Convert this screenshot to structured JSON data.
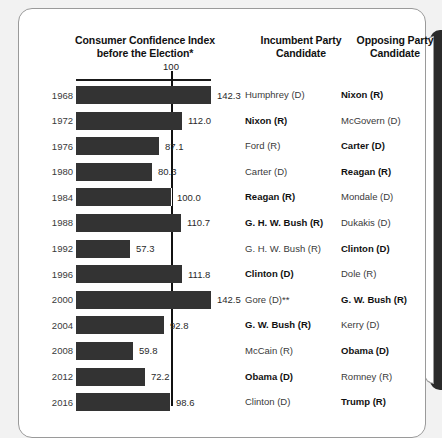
{
  "card": {
    "headers": {
      "chart_title_line1": "Consumer Confidence Index",
      "chart_title_line2": "before the Election*",
      "incumbent_line1": "Incumbent Party",
      "incumbent_line2": "Candidate",
      "opposing_line1": "Opposing Party",
      "opposing_line2": "Candidate"
    },
    "gridline_label": "100"
  },
  "chart_data": {
    "type": "bar",
    "orientation": "horizontal",
    "title": "Consumer Confidence Index before the Election*",
    "xlabel": "",
    "ylabel": "",
    "reference_line": 100,
    "reference_line_label": "100",
    "grid": false,
    "legend": null,
    "xlim": [
      0,
      150
    ],
    "categories": [
      "1968",
      "1972",
      "1976",
      "1980",
      "1984",
      "1988",
      "1992",
      "1996",
      "2000",
      "2004",
      "2008",
      "2012",
      "2016"
    ],
    "values": [
      142.3,
      112.0,
      87.1,
      80.3,
      100.0,
      110.7,
      57.3,
      111.8,
      142.5,
      92.8,
      59.8,
      72.2,
      98.6
    ],
    "value_labels": [
      "142.3",
      "112.0",
      "87.1",
      "80.3",
      "100.0",
      "110.7",
      "57.3",
      "111.8",
      "142.5",
      "92.8",
      "59.8",
      "72.2",
      "98.6"
    ],
    "bar_color": "#333333",
    "columns": [
      "Incumbent Party Candidate",
      "Opposing Party Candidate"
    ],
    "rows": [
      {
        "year": "1968",
        "value": 142.3,
        "value_label": "142.3",
        "incumbent": "Humphrey (D)",
        "incumbent_winner": false,
        "opposing": "Nixon (R)",
        "opposing_winner": true
      },
      {
        "year": "1972",
        "value": 112.0,
        "value_label": "112.0",
        "incumbent": "Nixon (R)",
        "incumbent_winner": true,
        "opposing": "McGovern (D)",
        "opposing_winner": false
      },
      {
        "year": "1976",
        "value": 87.1,
        "value_label": "87.1",
        "incumbent": "Ford (R)",
        "incumbent_winner": false,
        "opposing": "Carter (D)",
        "opposing_winner": true
      },
      {
        "year": "1980",
        "value": 80.3,
        "value_label": "80.3",
        "incumbent": "Carter (D)",
        "incumbent_winner": false,
        "opposing": "Reagan (R)",
        "opposing_winner": true
      },
      {
        "year": "1984",
        "value": 100.0,
        "value_label": "100.0",
        "incumbent": "Reagan (R)",
        "incumbent_winner": true,
        "opposing": "Mondale (D)",
        "opposing_winner": false
      },
      {
        "year": "1988",
        "value": 110.7,
        "value_label": "110.7",
        "incumbent": "G. H. W. Bush (R)",
        "incumbent_winner": true,
        "opposing": "Dukakis (D)",
        "opposing_winner": false
      },
      {
        "year": "1992",
        "value": 57.3,
        "value_label": "57.3",
        "incumbent": "G. H. W. Bush (R)",
        "incumbent_winner": false,
        "opposing": "Clinton (D)",
        "opposing_winner": true
      },
      {
        "year": "1996",
        "value": 111.8,
        "value_label": "111.8",
        "incumbent": "Clinton (D)",
        "incumbent_winner": true,
        "opposing": "Dole (R)",
        "opposing_winner": false
      },
      {
        "year": "2000",
        "value": 142.5,
        "value_label": "142.5",
        "incumbent": "Gore (D)**",
        "incumbent_winner": false,
        "opposing": "G. W. Bush (R)",
        "opposing_winner": true
      },
      {
        "year": "2004",
        "value": 92.8,
        "value_label": "92.8",
        "incumbent": "G. W. Bush (R)",
        "incumbent_winner": true,
        "opposing": "Kerry (D)",
        "opposing_winner": false
      },
      {
        "year": "2008",
        "value": 59.8,
        "value_label": "59.8",
        "incumbent": "McCain (R)",
        "incumbent_winner": false,
        "opposing": "Obama (D)",
        "opposing_winner": true
      },
      {
        "year": "2012",
        "value": 72.2,
        "value_label": "72.2",
        "incumbent": "Obama (D)",
        "incumbent_winner": true,
        "opposing": "Romney (R)",
        "opposing_winner": false
      },
      {
        "year": "2016",
        "value": 98.6,
        "value_label": "98.6",
        "incumbent": "Clinton (D)",
        "incumbent_winner": false,
        "opposing": "Trump (R)",
        "opposing_winner": true
      }
    ]
  }
}
